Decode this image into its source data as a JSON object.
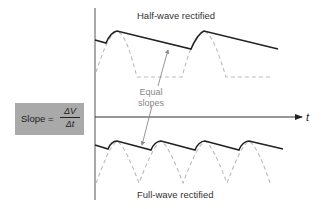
{
  "labels": {
    "top_title": "Half-wave rectified",
    "bottom_title": "Full-wave rectified",
    "annotation_line1": "Equal",
    "annotation_line2": "slopes",
    "slope_prefix": "Slope =",
    "slope_numerator": "ΔV",
    "slope_denominator": "Δt",
    "time_axis": "t"
  },
  "colors": {
    "waveform": "#222222",
    "dashed": "#bbbbbb",
    "axis": "#333333",
    "box": "#a9a9a9",
    "annotation": "#888888"
  }
}
